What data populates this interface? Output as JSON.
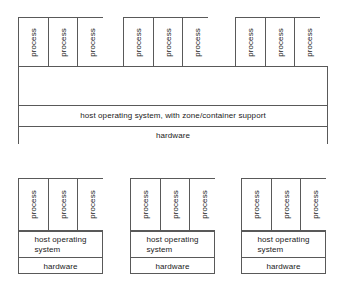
{
  "diagram": {
    "process_label": "process",
    "container_label": "container",
    "shared_host_os_label": "host operating system, with zone/container support",
    "host_os_label": "host operating\nsystem",
    "hardware_label": "hardware",
    "colors": {
      "line": "#595959",
      "text": "#1a1a1a",
      "background": "#ffffff"
    },
    "top_system": {
      "name": "shared-host-container-system",
      "containers": [
        {
          "label": "container",
          "processes": [
            "process",
            "process",
            "process"
          ]
        },
        {
          "label": "container",
          "processes": [
            "process",
            "process",
            "process"
          ]
        },
        {
          "label": "container",
          "processes": [
            "process",
            "process",
            "process"
          ]
        }
      ],
      "host_os": "host operating system, with zone/container support",
      "hardware": "hardware"
    },
    "bottom_systems": [
      {
        "name": "separate-system-1",
        "processes": [
          "process",
          "process",
          "process"
        ],
        "host_os": "host operating\nsystem",
        "hardware": "hardware"
      },
      {
        "name": "separate-system-2",
        "processes": [
          "process",
          "process",
          "process"
        ],
        "host_os": "host operating\nsystem",
        "hardware": "hardware"
      },
      {
        "name": "separate-system-3",
        "processes": [
          "process",
          "process",
          "process"
        ],
        "host_os": "host operating\nsystem",
        "hardware": "hardware"
      }
    ]
  }
}
